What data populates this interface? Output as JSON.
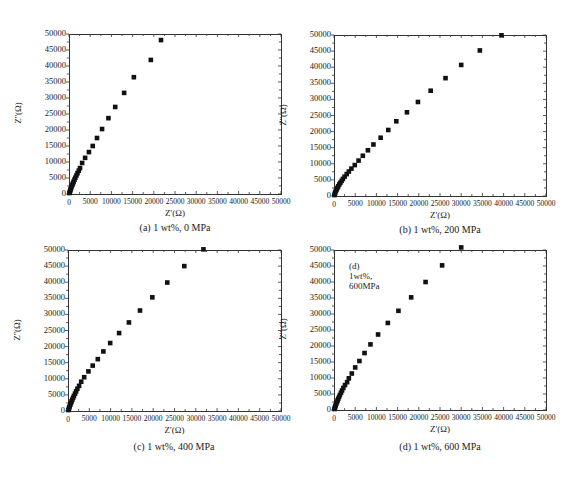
{
  "figure": {
    "panels": [
      {
        "id": "a",
        "caption": "(a) 1 wt%, 0 MPa",
        "xlabel": "Z'(Ω)",
        "ylabel": "Z''(Ω)",
        "inset": ""
      },
      {
        "id": "b",
        "caption": "(b) 1 wt%, 200 MPa",
        "xlabel": "Z'(Ω)",
        "ylabel": "Z''(Ω)",
        "inset": ""
      },
      {
        "id": "c",
        "caption": "(c) 1 wt%, 400 MPa",
        "xlabel": "Z'(Ω)",
        "ylabel": "Z''(Ω)",
        "inset": ""
      },
      {
        "id": "d",
        "caption": "(d) 1 wt%, 600 MPa",
        "xlabel": "Z'(Ω)",
        "ylabel": "Z''(Ω)",
        "inset": "(d) 1wt%, 600MPa"
      }
    ],
    "xticks": [
      "0",
      "5000",
      "10000",
      "15000",
      "20000",
      "25000",
      "30000",
      "35000",
      "40000",
      "45000",
      "50000"
    ],
    "yticks": [
      "0",
      "5000",
      "10000",
      "15000",
      "20000",
      "25000",
      "30000",
      "35000",
      "40000",
      "45000",
      "50000"
    ]
  },
  "chart_data": [
    {
      "type": "scatter",
      "title": "(a) 1 wt%, 0 MPa",
      "xlabel": "Z'(Ω)",
      "ylabel": "Z''(Ω)",
      "xlim": [
        0,
        50000
      ],
      "ylim": [
        0,
        50000
      ],
      "grid": false,
      "legend": "none",
      "marker": "filled-square",
      "x": [
        100,
        200,
        300,
        400,
        500,
        650,
        800,
        950,
        1100,
        1300,
        1500,
        1750,
        2000,
        2300,
        2600,
        3100,
        3800,
        4700,
        5600,
        6600,
        7800,
        9300,
        10900,
        13000,
        15300,
        19300,
        21700
      ],
      "y": [
        300,
        700,
        1100,
        1500,
        1900,
        2400,
        2900,
        3400,
        3900,
        4500,
        5100,
        5800,
        6500,
        7300,
        8100,
        9700,
        11300,
        13100,
        15000,
        17500,
        20300,
        23700,
        27200,
        31600,
        36500,
        41900,
        48100
      ]
    },
    {
      "type": "scatter",
      "title": "(b) 1 wt%, 200 MPa",
      "xlabel": "Z'(Ω)",
      "ylabel": "Z''(Ω)",
      "xlim": [
        0,
        50000
      ],
      "ylim": [
        0,
        50000
      ],
      "grid": false,
      "legend": "none",
      "marker": "filled-square",
      "x": [
        100,
        200,
        300,
        450,
        600,
        800,
        1000,
        1250,
        1500,
        1800,
        2100,
        2500,
        3000,
        3500,
        4100,
        4900,
        5800,
        6800,
        8000,
        9300,
        11000,
        12800,
        14700,
        17200,
        19800,
        22800,
        26300,
        30000,
        34400,
        39500
      ],
      "y": [
        300,
        700,
        1100,
        1600,
        2000,
        2500,
        3000,
        3600,
        4100,
        4700,
        5300,
        6000,
        6800,
        7600,
        8500,
        9600,
        11000,
        12500,
        14200,
        16000,
        18100,
        20500,
        23200,
        26000,
        29200,
        32700,
        36600,
        40700,
        45200,
        49900
      ]
    },
    {
      "type": "scatter",
      "title": "(c) 1 wt%, 400 MPa",
      "xlabel": "Z'(Ω)",
      "ylabel": "Z''(Ω)",
      "xlim": [
        0,
        50000
      ],
      "ylim": [
        0,
        50000
      ],
      "grid": false,
      "legend": "none",
      "marker": "filled-square",
      "x": [
        100,
        200,
        300,
        400,
        550,
        700,
        850,
        1000,
        1200,
        1400,
        1650,
        1900,
        2200,
        2600,
        3100,
        3800,
        4800,
        5800,
        7000,
        8300,
        9900,
        12000,
        14300,
        16900,
        19800,
        23300,
        27300,
        31800
      ],
      "y": [
        300,
        700,
        1100,
        1500,
        2000,
        2500,
        3000,
        3500,
        4100,
        4700,
        5400,
        6100,
        6900,
        7800,
        9100,
        10500,
        12300,
        14100,
        16100,
        18500,
        21100,
        24200,
        27500,
        31200,
        35300,
        39900,
        45000,
        50200
      ]
    },
    {
      "type": "scatter",
      "title": "(d) 1 wt%, 600 MPa",
      "xlabel": "Z'(Ω)",
      "ylabel": "Z''(Ω)",
      "xlim": [
        0,
        50000
      ],
      "ylim": [
        0,
        50000
      ],
      "grid": false,
      "legend": "none",
      "annotation": "(d) 1wt%, 600MPa",
      "marker": "filled-square",
      "x": [
        100,
        200,
        300,
        400,
        550,
        700,
        850,
        1000,
        1200,
        1400,
        1650,
        1900,
        2200,
        2600,
        3100,
        3500,
        4200,
        5000,
        6000,
        7200,
        8600,
        10400,
        12700,
        15200,
        18200,
        21600,
        25500,
        30000
      ],
      "y": [
        300,
        700,
        1100,
        1500,
        2000,
        2500,
        3000,
        3500,
        4100,
        4700,
        5400,
        6100,
        6900,
        7800,
        8700,
        9900,
        11400,
        13300,
        15300,
        17800,
        20500,
        23600,
        27200,
        31000,
        35200,
        40000,
        45200,
        50800
      ]
    }
  ]
}
